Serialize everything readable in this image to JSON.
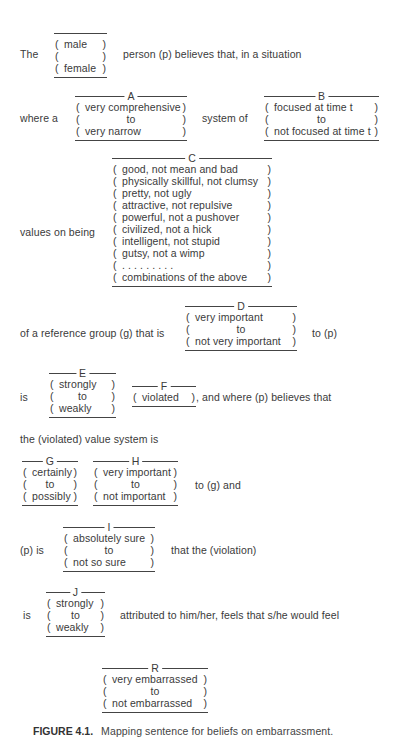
{
  "figure": {
    "caption_label": "FIGURE 4.1.",
    "caption_text": "Mapping sentence for beliefs on embarrassment."
  },
  "sentence": {
    "s1_pre": "The",
    "s1_post": "person (p) believes that, in a situation",
    "s2_pre": "where a",
    "s2_mid": "system of",
    "s3_pre": "values on being",
    "s4_pre": "of a reference group (g) that is",
    "s4_post": "to (p)",
    "s5_pre": "is",
    "s5_post": ",   and where (p) believes that",
    "s6": "the (violated) value system is",
    "s7_post": "to (g) and",
    "s8_pre": "(p) is",
    "s8_post": "that the (violation)",
    "s9_pre": "is",
    "s9_post": "attributed to him/her, feels that s/he would feel"
  },
  "facets": {
    "gender": {
      "letter": "",
      "values": [
        "male",
        "",
        "female"
      ]
    },
    "A": {
      "letter": "A",
      "values": [
        "very comprehensive",
        "to",
        "very narrow"
      ]
    },
    "B": {
      "letter": "B",
      "values": [
        "focused at time t",
        "to",
        "not focused at time t"
      ]
    },
    "C": {
      "letter": "C",
      "values": [
        "good, not mean and bad",
        "physically skillful, not clumsy",
        "pretty, not ugly",
        "attractive, not repulsive",
        "powerful, not a pushover",
        "civilized, not a hick",
        "intelligent, not stupid",
        "gutsy, not a wimp",
        ". . . . . . . . .",
        "combinations of the above"
      ]
    },
    "D": {
      "letter": "D",
      "values": [
        "very important",
        "to",
        "not very important"
      ]
    },
    "E": {
      "letter": "E",
      "values": [
        "strongly",
        "to",
        "weakly"
      ]
    },
    "F": {
      "letter": "F",
      "values": [
        "violated"
      ]
    },
    "G": {
      "letter": "G",
      "values": [
        "certainly",
        "to",
        "possibly"
      ]
    },
    "H": {
      "letter": "H",
      "values": [
        "very important",
        "to",
        "not important"
      ]
    },
    "I": {
      "letter": "I",
      "values": [
        "absolutely sure",
        "to",
        "not so sure"
      ]
    },
    "J": {
      "letter": "J",
      "values": [
        "strongly",
        "to",
        "weakly"
      ]
    },
    "R": {
      "letter": "R",
      "values": [
        "very embarrassed",
        "to",
        "not embarrassed"
      ]
    }
  },
  "colors": {
    "text": "#3a3a3a",
    "rule": "#444444",
    "background": "#ffffff"
  }
}
